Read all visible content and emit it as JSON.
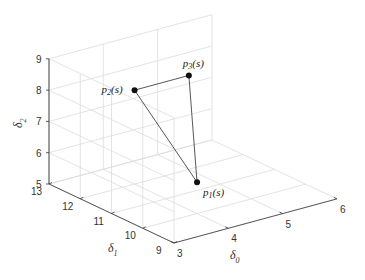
{
  "chart_data": {
    "type": "scatter",
    "projection": "3d",
    "title": "",
    "axes": {
      "x": {
        "label": "δ",
        "subscript": "0",
        "range": [
          3,
          6
        ],
        "ticks": [
          3,
          4,
          5,
          6
        ]
      },
      "y": {
        "label": "δ",
        "subscript": "1",
        "range": [
          9,
          13
        ],
        "ticks": [
          9,
          10,
          11,
          12,
          13
        ]
      },
      "z": {
        "label": "δ",
        "subscript": "2",
        "range": [
          5,
          9
        ],
        "ticks": [
          5,
          6,
          7,
          8,
          9
        ]
      }
    },
    "grid": true,
    "points": [
      {
        "name": "p1",
        "label": "p",
        "sub": "1",
        "suffix": "(s)",
        "x": 4,
        "y": 10,
        "z": 6,
        "label_pos": "below-right"
      },
      {
        "name": "p2",
        "label": "p",
        "sub": "2",
        "suffix": "(s)",
        "x": 4,
        "y": 12,
        "z": 8,
        "label_pos": "left"
      },
      {
        "name": "p3",
        "label": "p",
        "sub": "3",
        "suffix": "(s)",
        "x": 5,
        "y": 12,
        "z": 8,
        "label_pos": "above"
      }
    ],
    "edges": [
      [
        "p1",
        "p2"
      ],
      [
        "p2",
        "p3"
      ],
      [
        "p3",
        "p1"
      ]
    ],
    "colors": {
      "grid": "#dcdcdc",
      "axis": "#333333",
      "marker": "#111111",
      "line": "#444444"
    }
  }
}
